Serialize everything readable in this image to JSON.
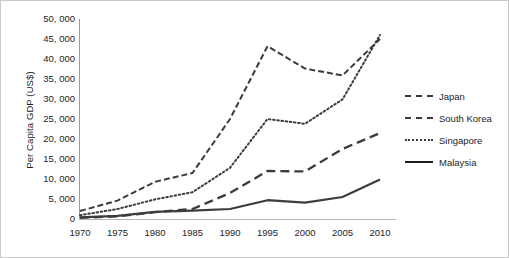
{
  "chart_data": {
    "type": "line",
    "title": "",
    "xlabel": "",
    "ylabel": "Per Capita GDP (US$)",
    "x": [
      1970,
      1975,
      1980,
      1985,
      1990,
      1995,
      2000,
      2005,
      2010
    ],
    "categories": [
      "1970",
      "1975",
      "1980",
      "1985",
      "1990",
      "1995",
      "2000",
      "2005",
      "2010"
    ],
    "xtick_labels": [
      "1970",
      "1975",
      "1980",
      "1985",
      "1990",
      "1995",
      "2000",
      "2005",
      "2010"
    ],
    "ytick_labels": [
      "0",
      "5, 000",
      "10, 000",
      "15, 000",
      "20, 000",
      "25, 000",
      "30, 000",
      "35, 000",
      "40, 000",
      "45, 000",
      "50, 000"
    ],
    "ytick_values": [
      0,
      5000,
      10000,
      15000,
      20000,
      25000,
      30000,
      35000,
      40000,
      45000,
      50000
    ],
    "ylim": [
      0,
      50000
    ],
    "xlim": [
      1970,
      2010
    ],
    "grid": false,
    "legend_position": "right",
    "series": [
      {
        "name": "Japan",
        "style": "dashed",
        "color": "#3c3c3c",
        "values": [
          2000,
          4600,
          9300,
          11500,
          25000,
          43200,
          37600,
          35900,
          45000
        ]
      },
      {
        "name": "South Korea",
        "style": "long-dashed",
        "color": "#3c3c3c",
        "values": [
          300,
          650,
          1700,
          2500,
          6500,
          12000,
          11900,
          17500,
          21500
        ]
      },
      {
        "name": "Singapore",
        "style": "dotted",
        "color": "#5a5a5a",
        "values": [
          950,
          2500,
          4900,
          6700,
          12800,
          25000,
          23800,
          29900,
          46000
        ]
      },
      {
        "name": "Malaysia",
        "style": "solid",
        "color": "#1b1b1b",
        "values": [
          400,
          800,
          1800,
          2100,
          2500,
          4700,
          4100,
          5500,
          9900
        ]
      }
    ]
  },
  "legend": {
    "entries": [
      {
        "label": "Japan"
      },
      {
        "label": "South Korea"
      },
      {
        "label": "Singapore"
      },
      {
        "label": "Malaysia"
      }
    ]
  }
}
